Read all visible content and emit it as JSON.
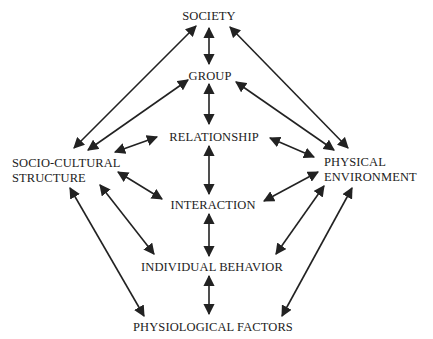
{
  "diagram": {
    "type": "relationship-diagram",
    "colors": {
      "ink": "#222222",
      "background": "#ffffff"
    },
    "nodes": {
      "society": {
        "label": "SOCIETY"
      },
      "group": {
        "label": "GROUP"
      },
      "relationship": {
        "label": "RELATIONSHIP"
      },
      "interaction": {
        "label": "INTERACTION"
      },
      "individual_behavior": {
        "label": "INDIVIDUAL BEHAVIOR"
      },
      "physiological_factors": {
        "label": "PHYSIOLOGICAL FACTORS"
      },
      "socio_cultural_structure": {
        "line1": "SOCIO-CULTURAL",
        "line2": "STRUCTURE"
      },
      "physical_environment": {
        "line1": "PHYSICAL",
        "line2": "ENVIRONMENT"
      }
    },
    "edges": [
      {
        "from": "society",
        "to": "group",
        "type": "bidirectional"
      },
      {
        "from": "group",
        "to": "relationship",
        "type": "bidirectional"
      },
      {
        "from": "relationship",
        "to": "interaction",
        "type": "bidirectional"
      },
      {
        "from": "interaction",
        "to": "individual_behavior",
        "type": "bidirectional"
      },
      {
        "from": "individual_behavior",
        "to": "physiological_factors",
        "type": "bidirectional"
      },
      {
        "from": "society",
        "to": "socio_cultural_structure",
        "type": "bidirectional"
      },
      {
        "from": "group",
        "to": "socio_cultural_structure",
        "type": "bidirectional"
      },
      {
        "from": "relationship",
        "to": "socio_cultural_structure",
        "type": "bidirectional"
      },
      {
        "from": "interaction",
        "to": "socio_cultural_structure",
        "type": "bidirectional"
      },
      {
        "from": "individual_behavior",
        "to": "socio_cultural_structure",
        "type": "bidirectional"
      },
      {
        "from": "physiological_factors",
        "to": "socio_cultural_structure",
        "type": "bidirectional"
      },
      {
        "from": "society",
        "to": "physical_environment",
        "type": "bidirectional"
      },
      {
        "from": "group",
        "to": "physical_environment",
        "type": "bidirectional"
      },
      {
        "from": "relationship",
        "to": "physical_environment",
        "type": "bidirectional"
      },
      {
        "from": "interaction",
        "to": "physical_environment",
        "type": "bidirectional"
      },
      {
        "from": "individual_behavior",
        "to": "physical_environment",
        "type": "bidirectional"
      },
      {
        "from": "physiological_factors",
        "to": "physical_environment",
        "type": "bidirectional"
      }
    ]
  }
}
